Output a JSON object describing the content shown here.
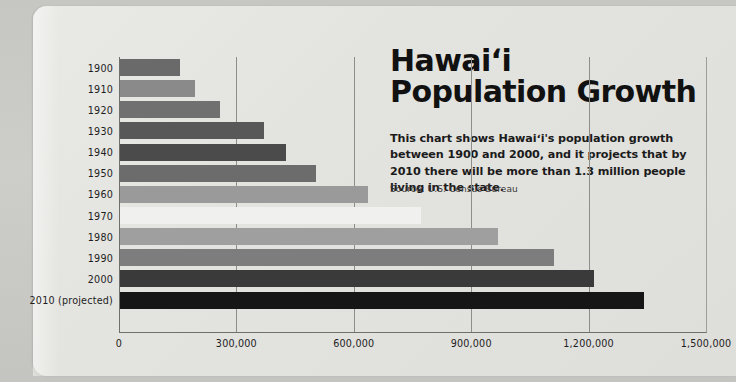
{
  "card": {
    "background_color": "#e4e4e0",
    "page_background_color": "#c9c9c5"
  },
  "title": "Hawaiʻi\nPopulation Growth",
  "description": "This chart shows Hawaiʻi's population growth between 1900 and 2000, and it projects that by 2010 there will be more than 1.3 million people living in the state.",
  "source": "Source: U.S. Census Bureau",
  "chart_data": {
    "type": "bar",
    "orientation": "horizontal",
    "title": "Hawaiʻi Population Growth",
    "xlabel": "",
    "ylabel": "",
    "xlim": [
      0,
      1500000
    ],
    "grid": true,
    "gridlines_x": [
      300000,
      600000,
      900000,
      1200000
    ],
    "xticks": [
      "0",
      "300,000",
      "600,000",
      "900,000",
      "1,200,000",
      "1,500,000"
    ],
    "xtick_values": [
      0,
      300000,
      600000,
      900000,
      1200000,
      1500000
    ],
    "legend": "none",
    "categories": [
      "1900",
      "1910",
      "1920",
      "1930",
      "1940",
      "1950",
      "1960",
      "1970",
      "1980",
      "1990",
      "2000",
      "2010 (projected)"
    ],
    "values": [
      154001,
      191874,
      255912,
      368336,
      423330,
      499794,
      632772,
      768561,
      964691,
      1108229,
      1211537,
      1340000
    ],
    "bar_colors": [
      "#6a6a6a",
      "#8a8a8a",
      "#707070",
      "#585858",
      "#4b4b4b",
      "#6c6c6c",
      "#9a9a9a",
      "#f0f0ee",
      "#9f9f9f",
      "#7d7d7d",
      "#3a3a3a",
      "#161616"
    ]
  }
}
